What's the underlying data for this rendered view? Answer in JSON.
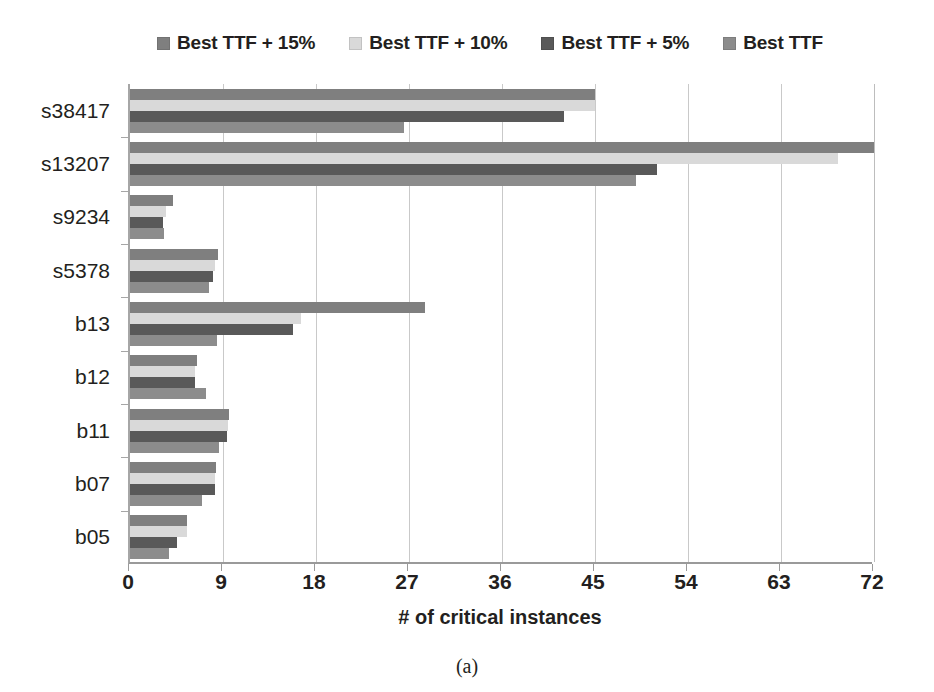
{
  "legend": {
    "position": "top-center",
    "entries": [
      {
        "label": "Best TTF + 15%",
        "color": "#7f7f7f",
        "icon": "legend-swatch-icon"
      },
      {
        "label": "Best TTF + 10%",
        "color": "#d9d9d9",
        "icon": "legend-swatch-icon"
      },
      {
        "label": "Best TTF + 5%",
        "color": "#595959",
        "icon": "legend-swatch-icon"
      },
      {
        "label": "Best TTF",
        "color": "#8c8c8c",
        "icon": "legend-swatch-icon"
      }
    ]
  },
  "caption": "(a)",
  "chart_data": {
    "type": "bar",
    "orientation": "horizontal",
    "title": "",
    "subtitle": "",
    "xlabel": "# of critical instances",
    "ylabel": "",
    "xlim": [
      0,
      72
    ],
    "ylim": null,
    "grid": "vertical",
    "xticks": [
      0,
      9,
      18,
      27,
      36,
      45,
      54,
      63,
      72
    ],
    "xtick_labels": [
      "0",
      "9",
      "18",
      "27",
      "36",
      "45",
      "54",
      "63",
      "72"
    ],
    "categories": [
      "s38417",
      "s13207",
      "s9234",
      "s5378",
      "b13",
      "b12",
      "b11",
      "b07",
      "b05"
    ],
    "series": [
      {
        "name": "Best TTF + 15%",
        "color": "#7f7f7f",
        "values": [
          45,
          72,
          4.2,
          8.5,
          28.5,
          6.5,
          9.6,
          8.3,
          5.5
        ]
      },
      {
        "name": "Best TTF + 10%",
        "color": "#d9d9d9",
        "values": [
          45,
          68.5,
          3.5,
          8.2,
          16.5,
          6.3,
          9.5,
          8.2,
          5.5
        ]
      },
      {
        "name": "Best TTF + 5%",
        "color": "#595959",
        "values": [
          42,
          51,
          3.2,
          8.0,
          15.8,
          6.3,
          9.4,
          8.2,
          4.5
        ]
      },
      {
        "name": "Best TTF",
        "color": "#8c8c8c",
        "values": [
          26.5,
          49,
          3.3,
          7.6,
          8.4,
          7.4,
          8.6,
          7.0,
          3.8
        ]
      }
    ]
  }
}
